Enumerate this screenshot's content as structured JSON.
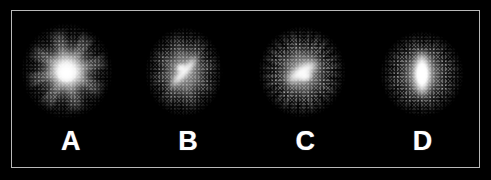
{
  "figure": {
    "background_color": "#000000",
    "frame_color": "#b9b9b9",
    "frame_background": "#010101",
    "label_color": "#ffffff",
    "panel_count": 4
  },
  "panels": [
    {
      "label": "A",
      "name": "panel-a",
      "morphology": "face-on spiral, unbarred",
      "center_x": 66,
      "center_y": 70,
      "halo_outer_w": 92,
      "halo_outer_h": 96,
      "halo_mid_w": 66,
      "halo_mid_h": 70,
      "core_w": 38,
      "core_h": 34,
      "core_angle_deg": -25,
      "core_blur_px": 5.0,
      "nucleus_w": 20,
      "nucleus_h": 18,
      "nucleus_offset_x": -1,
      "nucleus_offset_y": 3,
      "spiral_arms_opacity": 0.85,
      "ring_opacity": 0.25,
      "grain_opacity": 0.75,
      "brightness": 1.12
    },
    {
      "label": "B",
      "name": "panel-b",
      "morphology": "barred spiral, thin bar",
      "center_x": 183,
      "center_y": 71,
      "halo_outer_w": 78,
      "halo_outer_h": 90,
      "halo_mid_w": 54,
      "halo_mid_h": 66,
      "core_w": 48,
      "core_h": 11,
      "core_angle_deg": 48,
      "core_blur_px": 2.0,
      "nucleus_w": 13,
      "nucleus_h": 11,
      "nucleus_offset_x": -3,
      "nucleus_offset_y": -4,
      "spiral_arms_opacity": 0.35,
      "ring_opacity": 0.35,
      "grain_opacity": 0.9,
      "brightness": 1.0
    },
    {
      "label": "C",
      "name": "panel-c",
      "morphology": "barred spiral, thick bright bar",
      "center_x": 301,
      "center_y": 71,
      "halo_outer_w": 88,
      "halo_outer_h": 92,
      "halo_mid_w": 58,
      "halo_mid_h": 64,
      "core_w": 44,
      "core_h": 17,
      "core_angle_deg": 33,
      "core_blur_px": 2.4,
      "nucleus_w": 17,
      "nucleus_h": 14,
      "nucleus_offset_x": 3,
      "nucleus_offset_y": 4,
      "spiral_arms_opacity": 0.3,
      "ring_opacity": 0.85,
      "grain_opacity": 1.0,
      "brightness": 1.0
    },
    {
      "label": "D",
      "name": "panel-d",
      "morphology": "barred spiral, vertical bar",
      "center_x": 421,
      "center_y": 73,
      "halo_outer_w": 84,
      "halo_outer_h": 86,
      "halo_mid_w": 50,
      "halo_mid_h": 62,
      "core_w": 52,
      "core_h": 19,
      "core_angle_deg": 90,
      "core_blur_px": 2.6,
      "nucleus_w": 16,
      "nucleus_h": 26,
      "nucleus_offset_x": 0,
      "nucleus_offset_y": 0,
      "spiral_arms_opacity": 0.18,
      "ring_opacity": 0.45,
      "grain_opacity": 0.9,
      "brightness": 1.05
    }
  ]
}
